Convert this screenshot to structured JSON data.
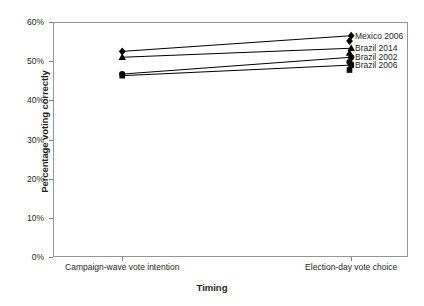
{
  "chart_data": {
    "type": "line",
    "title": "",
    "xlabel": "Timing",
    "ylabel": "Percentage voting correctly",
    "categories": [
      "Campaign-wave vote intention",
      "Election-day vote choice"
    ],
    "ylim": [
      0,
      60
    ],
    "yticks": [
      0,
      10,
      20,
      30,
      40,
      50,
      60
    ],
    "ytick_labels": [
      "0%",
      "10%",
      "20%",
      "30%",
      "40%",
      "50%",
      "60%"
    ],
    "grid": false,
    "legend_position": "right-inside-top",
    "series": [
      {
        "name": "Mexico 2006",
        "marker": "diamond",
        "values": [
          52.5,
          56.5
        ]
      },
      {
        "name": "Brazil 2014",
        "marker": "triangle",
        "values": [
          51.0,
          53.3
        ]
      },
      {
        "name": "Brazil 2002",
        "marker": "circle",
        "values": [
          46.7,
          51.0
        ]
      },
      {
        "name": "Brazil 2006",
        "marker": "square",
        "values": [
          46.3,
          49.0
        ]
      }
    ]
  },
  "axes": {
    "y_title": "Percentage voting correctly",
    "x_title": "Timing",
    "y_tick_labels": [
      "60%",
      "50%",
      "40%",
      "30%",
      "20%",
      "10%",
      "0%"
    ],
    "x_tick_labels": [
      "Campaign-wave vote intention",
      "Election-day vote choice"
    ]
  },
  "legend": {
    "items": [
      {
        "label": "Mexico 2006",
        "marker": "diamond-marker-icon"
      },
      {
        "label": "Brazil 2014",
        "marker": "triangle-marker-icon"
      },
      {
        "label": "Brazil 2002",
        "marker": "circle-marker-icon"
      },
      {
        "label": "Brazil 2006",
        "marker": "square-marker-icon"
      }
    ]
  },
  "colors": {
    "series": "#000000",
    "frame": "#939598",
    "tick": "#808285",
    "text": "#231f20",
    "background": "#ffffff"
  }
}
